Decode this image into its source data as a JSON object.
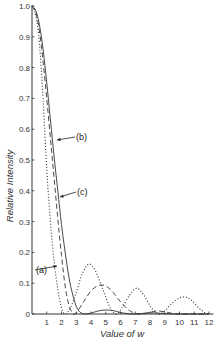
{
  "chart_data": {
    "type": "line",
    "title": "",
    "xlabel": "Value of w",
    "ylabel": "Relative Intensity",
    "xlim": [
      0,
      12.3
    ],
    "ylim": [
      0,
      1.0
    ],
    "x_ticks": [
      1,
      2,
      3,
      4,
      5,
      6,
      7,
      8,
      9,
      10,
      11,
      12
    ],
    "x_tick_labels": [
      "1",
      "2",
      "3",
      "4",
      "5",
      "6",
      "7",
      "8",
      "9",
      "10",
      "11",
      "12"
    ],
    "y_ticks": [
      0,
      0.1,
      0.2,
      0.3,
      0.4,
      0.5,
      0.6,
      0.7,
      0.8,
      0.9,
      1.0
    ],
    "y_tick_labels": [
      "0",
      "0.1",
      "0.2",
      "0.3",
      "0.4",
      "0.5",
      "0.6",
      "0.7",
      "0.8",
      "0.9",
      "1.0"
    ],
    "grid": false,
    "legend": "inline annotations with arrows",
    "series": [
      {
        "name": "(a)",
        "style": "dotted",
        "x": [
          0,
          0.25,
          0.5,
          0.75,
          1.0,
          1.25,
          1.5,
          1.75,
          2.0,
          2.25,
          2.6,
          3.0,
          3.4,
          3.86,
          4.3,
          4.8,
          5.3,
          5.7,
          6.1,
          6.6,
          7.1,
          7.6,
          8.1,
          8.6,
          9.0,
          9.5,
          10.0,
          10.4,
          10.8,
          11.3,
          11.7,
          12.0
        ],
        "y": [
          1.0,
          0.97,
          0.88,
          0.7,
          0.47,
          0.3,
          0.17,
          0.08,
          0.02,
          0.0,
          0.02,
          0.07,
          0.13,
          0.162,
          0.14,
          0.08,
          0.02,
          0.0,
          0.02,
          0.06,
          0.084,
          0.06,
          0.02,
          0.0,
          0.01,
          0.035,
          0.052,
          0.055,
          0.045,
          0.02,
          0.005,
          0.0
        ]
      },
      {
        "name": "(b)",
        "style": "solid",
        "x": [
          0,
          0.25,
          0.5,
          0.75,
          1.0,
          1.25,
          1.5,
          1.75,
          2.0,
          2.25,
          2.5,
          2.75,
          3.0,
          3.25,
          3.6,
          4.0,
          4.5,
          5.0,
          5.5,
          6.0,
          6.5,
          7.0,
          7.5,
          8.0,
          8.5,
          9.0,
          10.0,
          11.0,
          12.0
        ],
        "y": [
          1.0,
          0.985,
          0.94,
          0.86,
          0.75,
          0.63,
          0.51,
          0.4,
          0.29,
          0.2,
          0.12,
          0.065,
          0.025,
          0.006,
          0.0,
          0.003,
          0.01,
          0.013,
          0.011,
          0.005,
          0.001,
          0.0,
          0.002,
          0.004,
          0.003,
          0.001,
          0.0,
          0.0,
          0.0
        ]
      },
      {
        "name": "(c)",
        "style": "dashed",
        "x": [
          0,
          0.25,
          0.5,
          0.75,
          1.0,
          1.25,
          1.5,
          1.75,
          2.0,
          2.25,
          2.5,
          2.8,
          3.1,
          3.5,
          4.0,
          4.4,
          4.75,
          5.1,
          5.5,
          6.0,
          6.5,
          7.0,
          7.5,
          8.0,
          8.5,
          9.0,
          9.5,
          10.0,
          11.0,
          12.0
        ],
        "y": [
          1.0,
          0.98,
          0.92,
          0.82,
          0.7,
          0.57,
          0.44,
          0.31,
          0.19,
          0.09,
          0.03,
          0.0,
          0.01,
          0.04,
          0.075,
          0.09,
          0.094,
          0.088,
          0.07,
          0.04,
          0.015,
          0.002,
          0.0,
          0.006,
          0.01,
          0.007,
          0.002,
          0.0,
          0.0,
          0.0
        ]
      }
    ],
    "annotations": [
      {
        "label": "(a)",
        "text_x": 36,
        "text_y": 273,
        "arrow_to": [
          57,
          266
        ]
      },
      {
        "label": "(b)",
        "text_x": 76,
        "text_y": 140,
        "arrow_to": [
          57,
          140
        ]
      },
      {
        "label": "(c)",
        "text_x": 77,
        "text_y": 195,
        "arrow_to": [
          60,
          197
        ]
      }
    ]
  },
  "axes": {
    "x_title": "Value of w",
    "y_title": "Relative Intensity"
  }
}
